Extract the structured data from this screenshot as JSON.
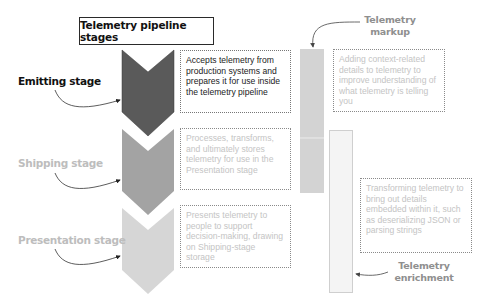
{
  "title": "Telemetry pipeline stages",
  "stages": [
    {
      "label": "Emitting stage",
      "color": "#5a5a5a",
      "label_color": "#111111",
      "description": "Accepts telemetry from production systems and prepares it for use inside the telemetry pipeline"
    },
    {
      "label": "Shipping stage",
      "color": "#a3a3a3",
      "label_color": "#bdbdbd",
      "description": "Processes, transforms, and ultimately stores telemetry for use in the Presentation stage"
    },
    {
      "label": "Presentation stage",
      "color": "#d6d6d6",
      "label_color": "#bdbdbd",
      "description": "Presents telemetry to people to support decision-making, drawing on Shipping-stage storage"
    }
  ],
  "side_processes": [
    {
      "label_line1": "Telemetry",
      "label_line2": "markup",
      "color": "#d3d3d3",
      "description": "Adding context-related details to telemetry to improve understanding of what telemetry is telling you"
    },
    {
      "label_line1": "Telemetry",
      "label_line2": "enrichment",
      "color": "#f3f3f3",
      "description": "Transforming telemetry to bring out details embedded within it, such as deserializing JSON or parsing strings"
    }
  ]
}
